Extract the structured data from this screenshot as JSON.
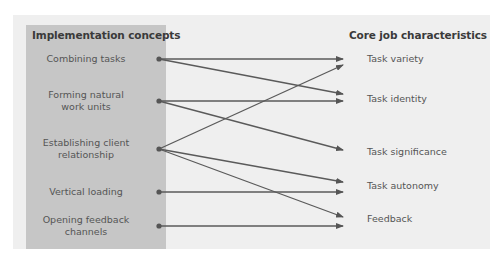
{
  "diagram": {
    "left_heading": "Implementation concepts",
    "right_heading": "Core job characteristics",
    "concepts": [
      {
        "label_line1": "Combining tasks",
        "label_line2": ""
      },
      {
        "label_line1": "Forming natural",
        "label_line2": "work units"
      },
      {
        "label_line1": "Establishing client",
        "label_line2": "relationship"
      },
      {
        "label_line1": "Vertical loading",
        "label_line2": ""
      },
      {
        "label_line1": "Opening feedback",
        "label_line2": "channels"
      }
    ],
    "characteristics": [
      {
        "label": "Task variety"
      },
      {
        "label": "Task identity"
      },
      {
        "label": "Task significance"
      },
      {
        "label": "Task autonomy"
      },
      {
        "label": "Feedback"
      }
    ],
    "connections": [
      {
        "from": "Combining tasks",
        "to": "Task variety"
      },
      {
        "from": "Combining tasks",
        "to": "Task identity"
      },
      {
        "from": "Forming natural work units",
        "to": "Task identity"
      },
      {
        "from": "Forming natural work units",
        "to": "Task significance"
      },
      {
        "from": "Establishing client relationship",
        "to": "Task variety"
      },
      {
        "from": "Establishing client relationship",
        "to": "Task autonomy"
      },
      {
        "from": "Establishing client relationship",
        "to": "Feedback"
      },
      {
        "from": "Vertical loading",
        "to": "Task autonomy"
      },
      {
        "from": "Opening feedback channels",
        "to": "Feedback"
      }
    ],
    "colors": {
      "outer_bg": "#efefef",
      "left_panel_bg": "#c6c6c6",
      "line": "#555555",
      "text": "#555555",
      "heading": "#3a3a3a"
    }
  }
}
